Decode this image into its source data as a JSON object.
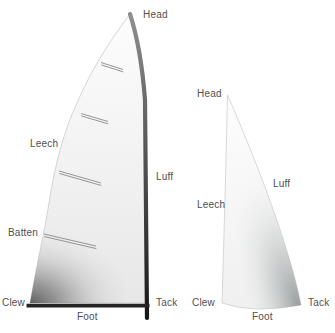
{
  "diagram": {
    "mainsail": {
      "labels": {
        "head": "Head",
        "leech": "Leech",
        "batten": "Batten",
        "clew": "Clew",
        "foot": "Foot",
        "luff": "Luff",
        "tack": "Tack"
      },
      "batten_count": 4
    },
    "jib": {
      "labels": {
        "head": "Head",
        "leech": "Leech",
        "luff": "Luff",
        "clew": "Clew",
        "foot": "Foot",
        "tack": "Tack"
      }
    },
    "colors": {
      "background": "#ffffff",
      "label_text": "#4f4f4f",
      "sail_top": "#fdfdfd",
      "sail_bottom": "#e9e9e9",
      "sail_edge": "#c4c4c4",
      "shadow_dark": "#4c4c4c",
      "jib_shadow": "#848a8a",
      "batten_line": "#8a8a8a",
      "mast_top": "#8f8f8f",
      "mast_bottom": "#161616",
      "boom": "#242424"
    }
  }
}
